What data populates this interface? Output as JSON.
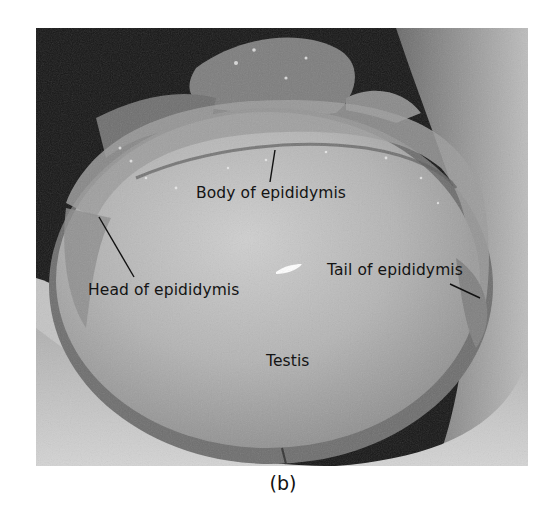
{
  "figure": {
    "caption": "(b)",
    "labels": {
      "body": "Body of epididymis",
      "head": "Head of epididymis",
      "tail": "Tail of epididymis",
      "testis": "Testis"
    }
  },
  "colors": {
    "background": "#ffffff",
    "label_text": "#141414",
    "leader_line": "#111111"
  }
}
